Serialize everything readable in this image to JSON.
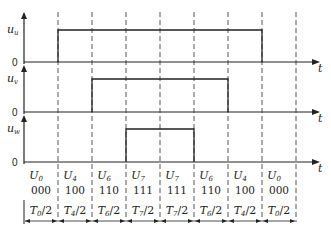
{
  "diagram": {
    "signals": [
      {
        "name": "u_u",
        "label_main": "u",
        "label_sub": "u",
        "zero_label": "0",
        "time_label": "t",
        "high_from": 1,
        "high_to": 7
      },
      {
        "name": "u_v",
        "label_main": "u",
        "label_sub": "v",
        "zero_label": "0",
        "time_label": "t",
        "high_from": 2,
        "high_to": 6
      },
      {
        "name": "u_w",
        "label_main": "u",
        "label_sub": "w",
        "zero_label": "0",
        "time_label": "t",
        "high_from": 3,
        "high_to": 5
      }
    ],
    "segments": [
      {
        "vector": "U",
        "vector_sub": "0",
        "code": "000",
        "time": "T",
        "time_sub": "0",
        "time_div": "/2"
      },
      {
        "vector": "U",
        "vector_sub": "4",
        "code": "100",
        "time": "T",
        "time_sub": "4",
        "time_div": "/2"
      },
      {
        "vector": "U",
        "vector_sub": "6",
        "code": "110",
        "time": "T",
        "time_sub": "6",
        "time_div": "/2"
      },
      {
        "vector": "U",
        "vector_sub": "7",
        "code": "111",
        "time": "T",
        "time_sub": "7",
        "time_div": "/2"
      },
      {
        "vector": "U",
        "vector_sub": "7",
        "code": "111",
        "time": "T",
        "time_sub": "7",
        "time_div": "/2"
      },
      {
        "vector": "U",
        "vector_sub": "6",
        "code": "110",
        "time": "T",
        "time_sub": "6",
        "time_div": "/2"
      },
      {
        "vector": "U",
        "vector_sub": "4",
        "code": "100",
        "time": "T",
        "time_sub": "4",
        "time_div": "/2"
      },
      {
        "vector": "U",
        "vector_sub": "0",
        "code": "000",
        "time": "T",
        "time_sub": "0",
        "time_div": "/2"
      }
    ],
    "colors": {
      "line": "#222222",
      "dash": "#555555",
      "background": "#ffffff"
    }
  }
}
